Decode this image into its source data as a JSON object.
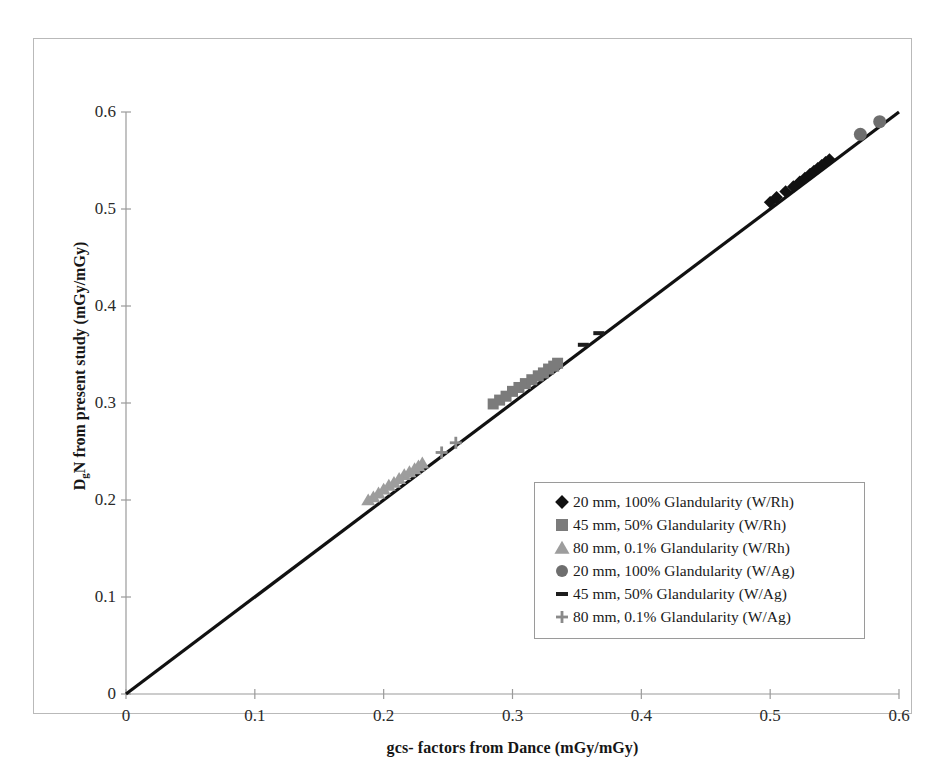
{
  "chart_data": {
    "type": "scatter",
    "title": "",
    "xlabel": "gcs- factors from Dance (mGy/mGy)",
    "ylabel": "DgN from present study (mGy/mGy)",
    "ylabel_main": "N from present study (mGy/mGy)",
    "ylabel_prefix": "D",
    "ylabel_sub": "g",
    "xlim": [
      0,
      0.6
    ],
    "ylim": [
      0,
      0.6
    ],
    "xticks": [
      "0",
      "0.1",
      "0.2",
      "0.3",
      "0.4",
      "0.5",
      "0.6"
    ],
    "yticks": [
      "0",
      "0.1",
      "0.2",
      "0.3",
      "0.4",
      "0.5",
      "0.6"
    ],
    "xtick_values": [
      0,
      0.1,
      0.2,
      0.3,
      0.4,
      0.5,
      0.6
    ],
    "ytick_values": [
      0,
      0.1,
      0.2,
      0.3,
      0.4,
      0.5,
      0.6
    ],
    "grid": false,
    "legend_position": "center-right",
    "identity_line": {
      "label": "y = x",
      "from": [
        0,
        0
      ],
      "to": [
        0.6,
        0.6
      ],
      "color": "#111111",
      "width": 3.2
    },
    "series": [
      {
        "name": "20 mm, 100% Glandularity (W/Rh)",
        "marker": "diamond",
        "color": "#111111",
        "size": 11,
        "points": [
          [
            0.5,
            0.507
          ],
          [
            0.505,
            0.512
          ],
          [
            0.512,
            0.518
          ],
          [
            0.518,
            0.523
          ],
          [
            0.523,
            0.528
          ],
          [
            0.527,
            0.532
          ],
          [
            0.531,
            0.536
          ],
          [
            0.534,
            0.539
          ],
          [
            0.537,
            0.542
          ],
          [
            0.54,
            0.545
          ],
          [
            0.543,
            0.548
          ],
          [
            0.546,
            0.551
          ]
        ]
      },
      {
        "name": "45 mm, 50% Glandularity (W/Rh)",
        "marker": "square",
        "color": "#7b7b7b",
        "size": 11,
        "points": [
          [
            0.285,
            0.299
          ],
          [
            0.29,
            0.303
          ],
          [
            0.295,
            0.307
          ],
          [
            0.3,
            0.312
          ],
          [
            0.305,
            0.316
          ],
          [
            0.31,
            0.32
          ],
          [
            0.315,
            0.324
          ],
          [
            0.32,
            0.328
          ],
          [
            0.324,
            0.331
          ],
          [
            0.328,
            0.335
          ],
          [
            0.332,
            0.338
          ],
          [
            0.335,
            0.341
          ]
        ]
      },
      {
        "name": "80 mm, 0.1% Glandularity (W/Rh)",
        "marker": "triangle",
        "color": "#9d9d9d",
        "size": 12,
        "points": [
          [
            0.188,
            0.2
          ],
          [
            0.192,
            0.203
          ],
          [
            0.196,
            0.207
          ],
          [
            0.2,
            0.211
          ],
          [
            0.204,
            0.215
          ],
          [
            0.208,
            0.218
          ],
          [
            0.212,
            0.222
          ],
          [
            0.216,
            0.226
          ],
          [
            0.22,
            0.229
          ],
          [
            0.224,
            0.232
          ],
          [
            0.227,
            0.235
          ],
          [
            0.23,
            0.238
          ]
        ]
      },
      {
        "name": "20 mm, 100% Glandularity (W/Ag)",
        "marker": "circle",
        "color": "#6e6e6e",
        "size": 13,
        "points": [
          [
            0.57,
            0.577
          ],
          [
            0.585,
            0.59
          ]
        ]
      },
      {
        "name": "45 mm, 50% Glandularity (W/Ag)",
        "marker": "dash",
        "color": "#1d1d1d",
        "size": 11,
        "points": [
          [
            0.355,
            0.36
          ],
          [
            0.367,
            0.372
          ]
        ]
      },
      {
        "name": "80 mm, 0.1% Glandularity (W/Ag)",
        "marker": "plus",
        "color": "#8a8a8a",
        "size": 12,
        "points": [
          [
            0.245,
            0.249
          ],
          [
            0.256,
            0.259
          ]
        ]
      }
    ]
  },
  "axes": {
    "x_title": "gcs- factors from Dance (mGy/mGy)",
    "y_title_prefix": "D",
    "y_title_sub": "g",
    "y_title_rest": "N from present study (mGy/mGy)"
  },
  "legend": {
    "entries": [
      {
        "label": "20 mm, 100% Glandularity (W/Rh)",
        "marker": "diamond",
        "color": "#111111"
      },
      {
        "label": "45 mm, 50% Glandularity (W/Rh)",
        "marker": "square",
        "color": "#7b7b7b"
      },
      {
        "label": "80 mm, 0.1% Glandularity (W/Rh)",
        "marker": "triangle",
        "color": "#9d9d9d"
      },
      {
        "label": "20 mm, 100% Glandularity (W/Ag)",
        "marker": "circle",
        "color": "#6e6e6e"
      },
      {
        "label": "45 mm, 50% Glandularity (W/Ag)",
        "marker": "dash",
        "color": "#1d1d1d"
      },
      {
        "label": "80 mm, 0.1% Glandularity (W/Ag)",
        "marker": "plus",
        "color": "#8a8a8a"
      }
    ]
  }
}
